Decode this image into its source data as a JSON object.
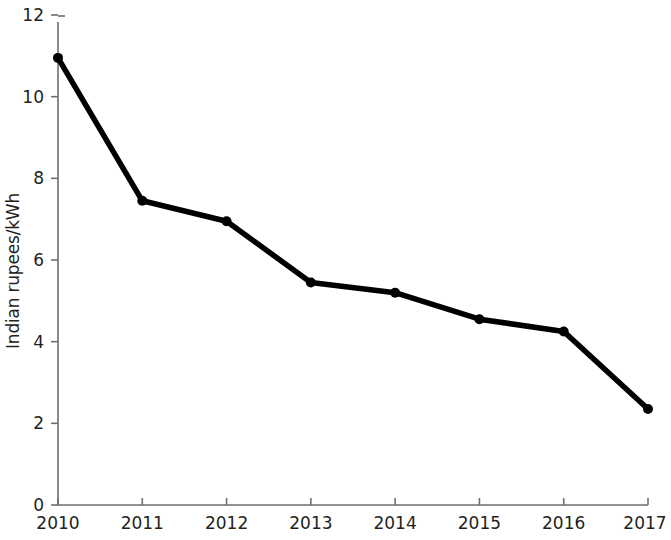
{
  "chart_data": {
    "type": "line",
    "title": "",
    "subtitle": "",
    "xlabel": "",
    "ylabel": "Indian rupees/kWh",
    "categories": [
      "2010",
      "2011",
      "2012",
      "2013",
      "2014",
      "2015",
      "2016",
      "2017"
    ],
    "x": [
      2010,
      2011,
      2012,
      2013,
      2014,
      2015,
      2016,
      2017
    ],
    "values": [
      10.95,
      7.45,
      6.95,
      5.45,
      5.2,
      4.55,
      4.25,
      2.35
    ],
    "series": [
      {
        "name": "Indian rupees/kWh",
        "values": [
          10.95,
          7.45,
          6.95,
          5.45,
          5.2,
          4.55,
          4.25,
          2.35
        ]
      }
    ],
    "ylim": [
      0,
      12
    ],
    "xlim": [
      2010,
      2017
    ],
    "yticks": [
      0,
      2,
      4,
      6,
      8,
      10,
      12
    ],
    "ytick_labels": [
      "0",
      "2",
      "4",
      "6",
      "8",
      "10",
      "12"
    ],
    "xticks": [
      2010,
      2011,
      2012,
      2013,
      2014,
      2015,
      2016,
      2017
    ],
    "xtick_labels": [
      "2010",
      "2011",
      "2012",
      "2013",
      "2014",
      "2015",
      "2016",
      "2017"
    ],
    "grid": false,
    "legend": false,
    "legend_position": "none",
    "annotations": [],
    "colors": {
      "series": "#000000",
      "axis": "#6f6f6f",
      "text": "#231f20",
      "background": "#ffffff"
    },
    "marker": "circle",
    "line_width_px": 5.5,
    "marker_size_px": 10
  }
}
